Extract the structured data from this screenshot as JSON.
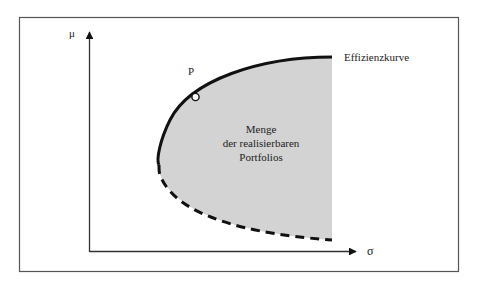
{
  "diagram": {
    "type": "efficient-frontier",
    "axes": {
      "y_label": "μ",
      "x_label": "σ"
    },
    "labels": {
      "point": "P",
      "frontier": "Effizienzkurve",
      "region_lines": [
        "Menge",
        "der realisierbaren",
        "Portfolios"
      ]
    },
    "styles": {
      "region_fill": "#d3d3d3",
      "line_color": "#111111",
      "frame_color": "#555555",
      "point_fill": "#ffffff"
    },
    "curve": {
      "upper_segment": "solid",
      "lower_segment": "dashed"
    }
  }
}
